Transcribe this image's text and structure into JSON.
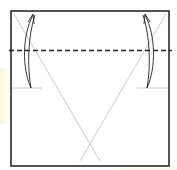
{
  "diagram": {
    "type": "origami-fold-step",
    "colors": {
      "paper_edge": "#2a2a2a",
      "crease": "#bdbdbd",
      "fold_line": "#222222",
      "arrow": "#222222",
      "background": "#ffffff"
    },
    "paper_square": {
      "x": 11,
      "y": 11,
      "width": 158,
      "height": 155
    },
    "valley_fold_line": {
      "y": 50,
      "x1": 9,
      "x2": 172,
      "style": "dashed"
    },
    "creases": [
      {
        "name": "diagonal-left",
        "x1": 14,
        "y1": 14,
        "x2": 100,
        "y2": 161
      },
      {
        "name": "diagonal-right",
        "x1": 166,
        "y1": 14,
        "x2": 80,
        "y2": 161
      },
      {
        "name": "reference-left",
        "x1": 12,
        "y1": 88,
        "x2": 42,
        "y2": 88
      },
      {
        "name": "reference-right",
        "x1": 137,
        "y1": 88,
        "x2": 168,
        "y2": 88
      }
    ],
    "fold_arrows": [
      {
        "name": "left-fold-arrow",
        "direction": "up",
        "from": [
          31,
          88
        ],
        "to": [
          33,
          15
        ]
      },
      {
        "name": "right-fold-arrow",
        "direction": "up",
        "from": [
          147,
          88
        ],
        "to": [
          145,
          15
        ]
      }
    ]
  }
}
